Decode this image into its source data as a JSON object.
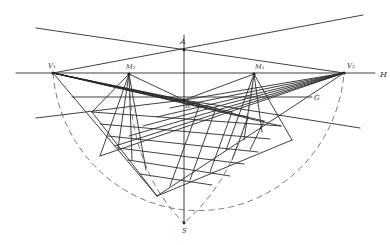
{
  "diagram": {
    "labels": {
      "A": "A",
      "B": "B",
      "S": "S",
      "V1": "V₁",
      "V2": "V₂",
      "M1": "M₁",
      "M2": "M₂",
      "H": "H",
      "G": "G"
    },
    "points": {
      "V1": [
        53,
        73
      ],
      "V2": [
        344,
        73
      ],
      "M1": [
        254,
        74
      ],
      "M2": [
        129,
        74
      ],
      "A": [
        184,
        50
      ],
      "B": [
        184,
        100
      ],
      "S": [
        184,
        223
      ]
    },
    "lines": {
      "horizon_H": {
        "from": [
          16,
          73
        ],
        "to": [
          375,
          73
        ]
      },
      "ground_G": {
        "from": [
          72,
          97
        ],
        "to": [
          312,
          97
        ]
      },
      "vertical_AS": {
        "from": [
          184,
          35
        ],
        "to": [
          184,
          223
        ]
      }
    },
    "colors": {
      "ink": "#2a2a2a",
      "dashed": "#555555",
      "background": "#ffffff"
    }
  }
}
